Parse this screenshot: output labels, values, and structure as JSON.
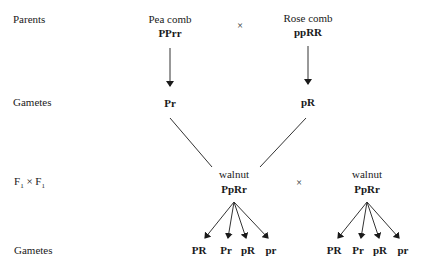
{
  "row_labels": {
    "parents": "Parents",
    "gametes1": "Gametes",
    "f1_cross": "F₁ × F₁",
    "gametes2": "Gametes"
  },
  "parent1": {
    "phenotype": "Pea comb",
    "genotype": "PPrr",
    "gamete": "Pr"
  },
  "parent2": {
    "phenotype": "Rose comb",
    "genotype": "ppRR",
    "gamete": "pR"
  },
  "cross_symbol": "×",
  "f1_left": {
    "phenotype": "walnut",
    "genotype": "PpRr",
    "gametes": [
      "PR",
      "Pr",
      "pR",
      "pr"
    ]
  },
  "f1_right": {
    "phenotype": "walnut",
    "genotype": "PpRr",
    "gametes": [
      "PR",
      "Pr",
      "pR",
      "pr"
    ]
  }
}
